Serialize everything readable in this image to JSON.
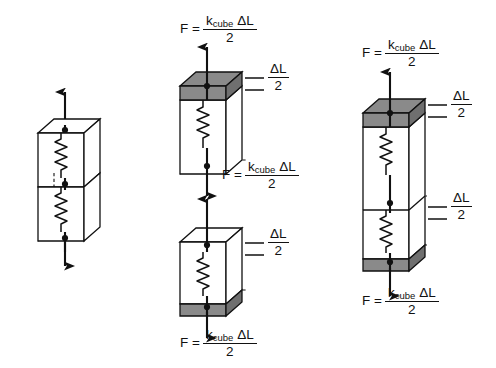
{
  "figure": {
    "type": "physics-diagram",
    "background_color": "#ffffff",
    "line_color": "#111111",
    "slab_fill_color": "#8a8a8a",
    "face_fill_color": "#ffffff"
  },
  "symbols": {
    "force_lhs": "F =",
    "k_symbol": "k",
    "k_subscript": "cube",
    "delta_L": "ΔL",
    "denominator": "2",
    "delta_label_numerator": "ΔL",
    "delta_label_denominator": "2"
  },
  "panels": [
    {
      "id": "left",
      "name": "unstretched-stack",
      "cube_count": 2,
      "springs": 2,
      "nodes": 3,
      "slabs": [],
      "arrows": [
        {
          "name": "arrow-up-top",
          "direction": "up"
        },
        {
          "name": "arrow-down-bottom",
          "direction": "down"
        }
      ],
      "force_labels": [],
      "elongation_labels": []
    },
    {
      "id": "middle",
      "name": "separated-cubes",
      "cube_count": 2,
      "springs": 2,
      "nodes": 4,
      "slabs": [
        {
          "name": "slab-top-of-upper-cube",
          "position": "top"
        },
        {
          "name": "slab-bottom-of-lower-cube",
          "position": "bottom"
        }
      ],
      "arrows": [
        {
          "name": "arrow-up-above-upper-cube",
          "direction": "up"
        },
        {
          "name": "arrow-down-below-upper-cube",
          "direction": "down"
        },
        {
          "name": "arrow-up-above-lower-cube",
          "direction": "up"
        },
        {
          "name": "arrow-down-below-lower-cube",
          "direction": "down"
        }
      ],
      "force_labels": [
        {
          "name": "force-label-top",
          "lhs": "F =",
          "numerator": "k_cube ΔL",
          "denominator": "2"
        },
        {
          "name": "force-label-middle",
          "lhs": "F =",
          "numerator": "k_cube ΔL",
          "denominator": "2"
        },
        {
          "name": "force-label-bottom",
          "lhs": "F =",
          "numerator": "k_cube ΔL",
          "denominator": "2"
        }
      ],
      "elongation_labels": [
        {
          "name": "elongation-label-upper-cube",
          "value": "ΔL/2"
        },
        {
          "name": "elongation-label-lower-cube",
          "value": "ΔL/2"
        }
      ]
    },
    {
      "id": "right",
      "name": "combined-stretched-stack",
      "cube_count": 2,
      "springs": 2,
      "nodes": 3,
      "slabs": [
        {
          "name": "slab-top",
          "position": "top"
        },
        {
          "name": "slab-bottom",
          "position": "bottom"
        }
      ],
      "arrows": [
        {
          "name": "arrow-up-top",
          "direction": "up"
        },
        {
          "name": "arrow-down-bottom",
          "direction": "down"
        }
      ],
      "force_labels": [
        {
          "name": "force-label-top",
          "lhs": "F =",
          "numerator": "k_cube ΔL",
          "denominator": "2"
        },
        {
          "name": "force-label-bottom",
          "lhs": "F =",
          "numerator": "k_cube ΔL",
          "denominator": "2"
        }
      ],
      "elongation_labels": [
        {
          "name": "elongation-label-top",
          "value": "ΔL/2"
        },
        {
          "name": "elongation-label-bottom",
          "value": "ΔL/2"
        }
      ]
    }
  ]
}
